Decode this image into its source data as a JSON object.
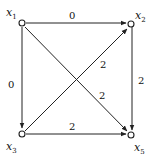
{
  "diagram": {
    "type": "directed-graph",
    "nodes": [
      {
        "id": "x1",
        "name": "x",
        "sub": "1"
      },
      {
        "id": "x2",
        "name": "x",
        "sub": "2"
      },
      {
        "id": "x3",
        "name": "x",
        "sub": "3"
      },
      {
        "id": "x5",
        "name": "x",
        "sub": "5"
      }
    ],
    "edges": [
      {
        "from": "x1",
        "to": "x2",
        "weight": "0"
      },
      {
        "from": "x1",
        "to": "x3",
        "weight": "0"
      },
      {
        "from": "x1",
        "to": "x5",
        "weight": "2"
      },
      {
        "from": "x3",
        "to": "x2",
        "weight": "2"
      },
      {
        "from": "x2",
        "to": "x5",
        "weight": "2"
      },
      {
        "from": "x3",
        "to": "x5",
        "weight": "2"
      }
    ]
  }
}
